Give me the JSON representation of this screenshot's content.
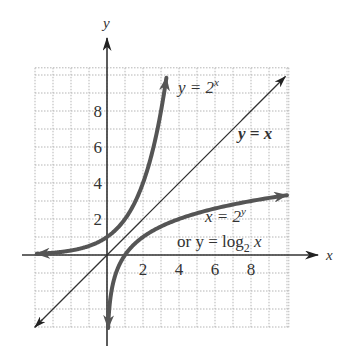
{
  "chart_data": {
    "type": "line",
    "title": "",
    "xlabel": "x",
    "ylabel": "y",
    "xlim": [
      -4,
      10
    ],
    "ylim": [
      -4,
      10.4
    ],
    "grid": true,
    "x_ticks": [
      "2",
      "4",
      "6",
      "8"
    ],
    "y_ticks": [
      "2",
      "4",
      "6",
      "8"
    ],
    "series": [
      {
        "name": "y = 2^x",
        "label": "y = 2",
        "label_sup": "x",
        "color": "#555555",
        "function": "2^x",
        "x_range": [
          -3.9,
          3.3
        ]
      },
      {
        "name": "y = x",
        "label": "y = x",
        "color": "#333333",
        "function": "x",
        "x_range": [
          -4,
          9.9
        ]
      },
      {
        "name": "x = 2^y or y = log2 x",
        "label_line1_main": "x = 2",
        "label_line1_sup": "y",
        "label_line2_prefix": "or  y = log",
        "label_line2_sub": "2",
        "label_line2_suffix": " x",
        "color": "#555555",
        "function": "log2(x)",
        "x_range": [
          0.06,
          10
        ]
      }
    ],
    "annotations": [
      "y = 2^x",
      "y = x",
      "x = 2^y",
      "or y = log2 x"
    ]
  }
}
